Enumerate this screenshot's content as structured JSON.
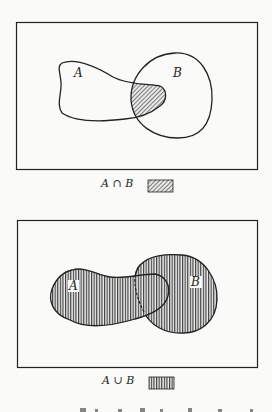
{
  "diagrams": [
    {
      "name": "intersection",
      "set_labels": [
        "A",
        "B"
      ],
      "legend_label": "A ∩ B",
      "legend_pattern": "diagonal-hatch"
    },
    {
      "name": "union",
      "set_labels": [
        "A",
        "B"
      ],
      "legend_label": "A ∪ B",
      "legend_pattern": "vertical-hatch"
    }
  ],
  "colors": {
    "stroke": "#222222",
    "background": "#fafaf8"
  }
}
